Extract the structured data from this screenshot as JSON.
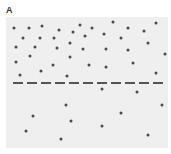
{
  "panel": {
    "label": "A"
  },
  "box": {
    "left": 6,
    "top": 17,
    "width": 162,
    "height": 131,
    "fill": "#efefef"
  },
  "threshold_line": {
    "y": 83,
    "x_start": 13,
    "x_end": 167,
    "dash_count": 11,
    "dash_width": 10,
    "dash_period": 14,
    "color": "#555555"
  },
  "dots_color": "#4a4a4a",
  "dots_above": [
    [
      14,
      28
    ],
    [
      29,
      28
    ],
    [
      42,
      26
    ],
    [
      59,
      30
    ],
    [
      80,
      25
    ],
    [
      92,
      28
    ],
    [
      113,
      22
    ],
    [
      128,
      28
    ],
    [
      144,
      31
    ],
    [
      156,
      23
    ],
    [
      23,
      38
    ],
    [
      40,
      38
    ],
    [
      54,
      38
    ],
    [
      73,
      32
    ],
    [
      85,
      36
    ],
    [
      104,
      34
    ],
    [
      121,
      38
    ],
    [
      70,
      43
    ],
    [
      148,
      43
    ],
    [
      16,
      47
    ],
    [
      35,
      47
    ],
    [
      57,
      48
    ],
    [
      83,
      49
    ],
    [
      106,
      49
    ],
    [
      128,
      50
    ],
    [
      165,
      54
    ],
    [
      30,
      56
    ],
    [
      70,
      57
    ],
    [
      16,
      62
    ],
    [
      53,
      65
    ],
    [
      89,
      65
    ],
    [
      106,
      67
    ],
    [
      133,
      63
    ],
    [
      20,
      75
    ],
    [
      41,
      71
    ],
    [
      67,
      76
    ],
    [
      156,
      73
    ]
  ],
  "dots_below": [
    [
      102,
      89
    ],
    [
      137,
      92
    ],
    [
      66,
      105
    ],
    [
      162,
      105
    ],
    [
      33,
      116
    ],
    [
      121,
      113
    ],
    [
      71,
      121
    ],
    [
      102,
      126
    ],
    [
      26,
      131
    ],
    [
      61,
      139
    ],
    [
      148,
      135
    ]
  ]
}
